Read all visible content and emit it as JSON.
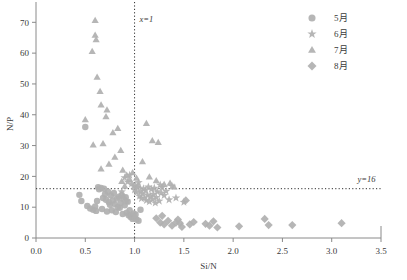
{
  "chart_data": {
    "type": "scatter",
    "title": "",
    "xlabel": "Si/N",
    "ylabel": "N/P",
    "xlim": [
      0.0,
      3.5
    ],
    "ylim": [
      0,
      74
    ],
    "xticks": [
      "0.0",
      "0.5",
      "1.0",
      "1.5",
      "2.0",
      "2.5",
      "3.0",
      "3.5"
    ],
    "xtick_values": [
      0.0,
      0.5,
      1.0,
      1.5,
      2.0,
      2.5,
      3.0,
      3.5
    ],
    "yticks": [
      "0",
      "10",
      "20",
      "30",
      "40",
      "50",
      "60",
      "70"
    ],
    "ytick_values": [
      0,
      10,
      20,
      30,
      40,
      50,
      60,
      70
    ],
    "grid": false,
    "legend_position": "top-right",
    "marker_color": "#b0b0b0",
    "annotations": [
      {
        "text": "x=1",
        "x": 1.0,
        "y": 70,
        "kind": "vline-label"
      },
      {
        "text": "y=16",
        "x": 3.2,
        "y": 18.2,
        "kind": "hline-label"
      }
    ],
    "reference_lines": [
      {
        "orientation": "vertical",
        "value": 1.0,
        "label": "x=1",
        "style": "dotted"
      },
      {
        "orientation": "horizontal",
        "value": 16,
        "label": "y=16",
        "style": "dotted"
      }
    ],
    "series": [
      {
        "name": "5月1",
        "label": "5月",
        "marker": "circle",
        "color": "#b0b0b0",
        "points": [
          [
            0.46,
            12.0
          ],
          [
            0.52,
            10.4
          ],
          [
            0.55,
            9.6
          ],
          [
            0.58,
            9.2
          ],
          [
            0.6,
            10.2
          ],
          [
            0.61,
            8.8
          ],
          [
            0.63,
            16.5
          ],
          [
            0.64,
            15.8
          ],
          [
            0.66,
            16.2
          ],
          [
            0.67,
            9.4
          ],
          [
            0.68,
            13.0
          ],
          [
            0.7,
            14.2
          ],
          [
            0.71,
            12.4
          ],
          [
            0.72,
            8.6
          ],
          [
            0.73,
            15.0
          ],
          [
            0.74,
            11.6
          ],
          [
            0.75,
            10.8
          ],
          [
            0.76,
            13.8
          ],
          [
            0.77,
            9.0
          ],
          [
            0.78,
            12.2
          ],
          [
            0.79,
            14.6
          ],
          [
            0.8,
            11.0
          ],
          [
            0.81,
            8.4
          ],
          [
            0.82,
            12.8
          ],
          [
            0.83,
            10.0
          ],
          [
            0.84,
            13.4
          ],
          [
            0.85,
            9.8
          ],
          [
            0.86,
            11.4
          ],
          [
            0.87,
            14.0
          ],
          [
            0.88,
            7.8
          ],
          [
            0.89,
            12.6
          ],
          [
            0.9,
            10.6
          ],
          [
            0.91,
            13.2
          ],
          [
            0.92,
            8.2
          ],
          [
            0.93,
            11.8
          ],
          [
            0.94,
            7.4
          ],
          [
            0.95,
            9.0
          ],
          [
            0.96,
            6.8
          ],
          [
            0.97,
            7.2
          ],
          [
            0.98,
            6.2
          ],
          [
            0.99,
            8.0
          ],
          [
            1.0,
            6.6
          ],
          [
            1.01,
            7.6
          ],
          [
            1.02,
            6.0
          ],
          [
            1.04,
            5.6
          ],
          [
            0.5,
            36.0
          ],
          [
            0.44,
            14.0
          ],
          [
            0.62,
            12.0
          ],
          [
            0.69,
            16.0
          ],
          [
            1.06,
            9.2
          ]
        ]
      },
      {
        "name": "6月1",
        "label": "6月",
        "marker": "star",
        "color": "#b0b0b0",
        "points": [
          [
            0.9,
            19.6
          ],
          [
            0.93,
            18.2
          ],
          [
            0.95,
            20.4
          ],
          [
            0.97,
            17.6
          ],
          [
            0.99,
            16.8
          ],
          [
            1.0,
            15.6
          ],
          [
            1.01,
            17.0
          ],
          [
            1.02,
            14.8
          ],
          [
            1.03,
            16.4
          ],
          [
            1.05,
            13.6
          ],
          [
            1.06,
            15.2
          ],
          [
            1.07,
            12.8
          ],
          [
            1.08,
            14.4
          ],
          [
            1.09,
            16.0
          ],
          [
            1.1,
            13.0
          ],
          [
            1.11,
            15.4
          ],
          [
            1.12,
            12.2
          ],
          [
            1.13,
            14.0
          ],
          [
            1.14,
            16.6
          ],
          [
            1.15,
            11.8
          ],
          [
            1.16,
            13.6
          ],
          [
            1.17,
            15.8
          ],
          [
            1.18,
            12.6
          ],
          [
            1.19,
            14.2
          ],
          [
            1.2,
            16.2
          ],
          [
            1.21,
            11.4
          ],
          [
            1.22,
            13.2
          ],
          [
            1.23,
            15.0
          ],
          [
            1.25,
            12.0
          ],
          [
            1.27,
            14.6
          ],
          [
            1.28,
            16.4
          ],
          [
            1.3,
            13.8
          ],
          [
            1.32,
            15.2
          ],
          [
            1.35,
            12.4
          ],
          [
            1.38,
            16.8
          ],
          [
            1.42,
            13.0
          ],
          [
            1.5,
            11.6
          ],
          [
            0.87,
            15.0
          ],
          [
            0.88,
            13.4
          ],
          [
            0.92,
            12.0
          ],
          [
            1.04,
            18.0
          ],
          [
            1.26,
            17.2
          ]
        ]
      },
      {
        "name": "7月1",
        "label": "7月",
        "marker": "triangle",
        "color": "#b0b0b0",
        "points": [
          [
            0.6,
            70.6
          ],
          [
            0.6,
            65.8
          ],
          [
            0.61,
            64.4
          ],
          [
            0.57,
            60.6
          ],
          [
            0.62,
            52.2
          ],
          [
            0.65,
            47.6
          ],
          [
            0.66,
            43.2
          ],
          [
            0.72,
            41.6
          ],
          [
            0.71,
            39.4
          ],
          [
            0.5,
            38.4
          ],
          [
            0.78,
            34.2
          ],
          [
            0.83,
            35.6
          ],
          [
            0.68,
            30.6
          ],
          [
            0.58,
            30.2
          ],
          [
            0.86,
            28.4
          ],
          [
            0.8,
            26.2
          ],
          [
            0.74,
            24.0
          ],
          [
            0.66,
            22.4
          ],
          [
            0.88,
            22.0
          ],
          [
            0.92,
            20.4
          ],
          [
            0.95,
            19.0
          ],
          [
            0.87,
            18.4
          ],
          [
            1.12,
            37.2
          ],
          [
            1.18,
            31.6
          ],
          [
            1.24,
            31.0
          ],
          [
            1.08,
            24.8
          ],
          [
            1.15,
            19.8
          ],
          [
            1.22,
            18.6
          ],
          [
            1.3,
            17.4
          ],
          [
            1.04,
            17.0
          ],
          [
            0.98,
            21.2
          ],
          [
            1.02,
            19.4
          ],
          [
            1.4,
            16.6
          ],
          [
            1.36,
            17.8
          ],
          [
            0.9,
            16.8
          ]
        ]
      },
      {
        "name": "8月1",
        "label": "8月",
        "marker": "diamond",
        "color": "#b0b0b0",
        "points": [
          [
            1.22,
            6.4
          ],
          [
            1.26,
            5.0
          ],
          [
            1.3,
            4.4
          ],
          [
            1.34,
            5.6
          ],
          [
            1.38,
            4.0
          ],
          [
            1.44,
            6.0
          ],
          [
            1.46,
            4.8
          ],
          [
            1.48,
            3.6
          ],
          [
            1.52,
            12.2
          ],
          [
            1.6,
            5.2
          ],
          [
            1.72,
            4.6
          ],
          [
            1.76,
            4.0
          ],
          [
            1.8,
            5.4
          ],
          [
            1.84,
            3.4
          ],
          [
            2.06,
            3.8
          ],
          [
            2.32,
            6.2
          ],
          [
            2.36,
            4.2
          ],
          [
            2.6,
            4.2
          ],
          [
            3.1,
            4.8
          ],
          [
            1.28,
            7.2
          ],
          [
            1.42,
            5.0
          ],
          [
            1.56,
            4.4
          ]
        ]
      }
    ]
  },
  "legend": {
    "items": [
      {
        "label": "5月",
        "marker": "circle"
      },
      {
        "label": "6月",
        "marker": "star"
      },
      {
        "label": "7月",
        "marker": "triangle"
      },
      {
        "label": "8月",
        "marker": "diamond"
      }
    ]
  }
}
